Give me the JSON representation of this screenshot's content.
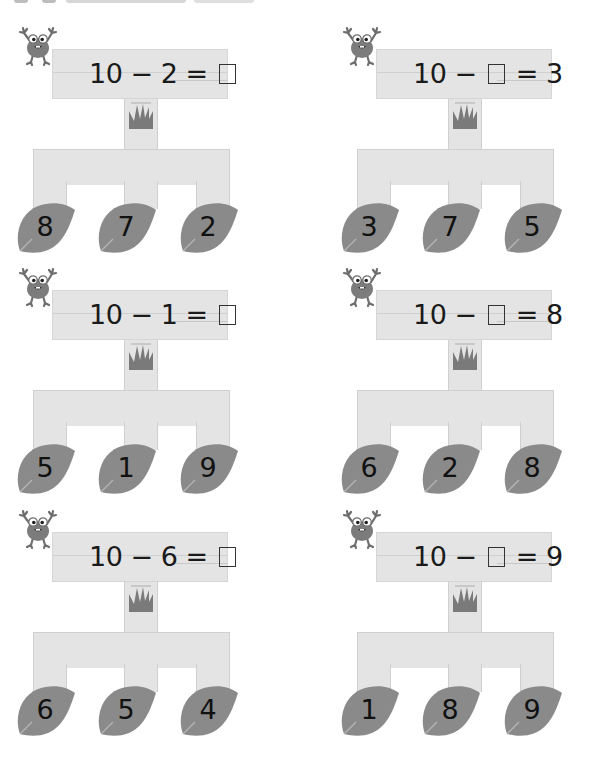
{
  "colors": {
    "sign": "#e4e4e4",
    "leaf": "#8a8a8a",
    "frog": "#7c7c7c",
    "grass": "#7a7a7a",
    "text": "#1a1a1a"
  },
  "icons": {
    "frog": "frog-icon",
    "grass": "grass-icon",
    "leaf": "leaf-icon",
    "blank_box": "answer-box"
  },
  "puzzles": [
    {
      "equation": {
        "a": "10",
        "op": "−",
        "b": "2",
        "eq": "=",
        "c": "",
        "blank_position": "result"
      },
      "leaves": [
        "8",
        "7",
        "2"
      ]
    },
    {
      "equation": {
        "a": "10",
        "op": "−",
        "b": "",
        "eq": "=",
        "c": "3",
        "blank_position": "subtrahend"
      },
      "leaves": [
        "3",
        "7",
        "5"
      ]
    },
    {
      "equation": {
        "a": "10",
        "op": "−",
        "b": "1",
        "eq": "=",
        "c": "",
        "blank_position": "result"
      },
      "leaves": [
        "5",
        "1",
        "9"
      ]
    },
    {
      "equation": {
        "a": "10",
        "op": "−",
        "b": "",
        "eq": "=",
        "c": "8",
        "blank_position": "subtrahend"
      },
      "leaves": [
        "6",
        "2",
        "8"
      ]
    },
    {
      "equation": {
        "a": "10",
        "op": "−",
        "b": "6",
        "eq": "=",
        "c": "",
        "blank_position": "result"
      },
      "leaves": [
        "6",
        "5",
        "4"
      ]
    },
    {
      "equation": {
        "a": "10",
        "op": "−",
        "b": "",
        "eq": "=",
        "c": "9",
        "blank_position": "subtrahend"
      },
      "leaves": [
        "1",
        "8",
        "9"
      ]
    }
  ]
}
